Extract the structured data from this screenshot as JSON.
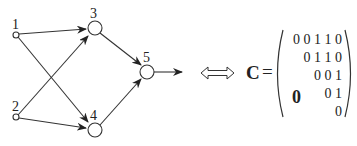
{
  "diagram": {
    "type": "directed network graph with connectivity matrix",
    "nodes": [
      {
        "id": "1",
        "label": "1",
        "kind": "input"
      },
      {
        "id": "2",
        "label": "2",
        "kind": "input"
      },
      {
        "id": "3",
        "label": "3",
        "kind": "hidden"
      },
      {
        "id": "4",
        "label": "4",
        "kind": "hidden"
      },
      {
        "id": "5",
        "label": "5",
        "kind": "output"
      }
    ],
    "edges": [
      {
        "from": "1",
        "to": "3"
      },
      {
        "from": "1",
        "to": "4"
      },
      {
        "from": "2",
        "to": "3"
      },
      {
        "from": "2",
        "to": "4"
      },
      {
        "from": "3",
        "to": "5"
      },
      {
        "from": "4",
        "to": "5"
      },
      {
        "from": "5",
        "to": "output"
      }
    ],
    "equivalence_symbol": "⟺",
    "matrix": {
      "name": "C",
      "equals": "=",
      "rows": [
        "0 0 1 1 0",
        "0 1 1 0",
        "0 0 1",
        "0 1",
        "0"
      ],
      "lower_triangle_label": "0"
    }
  }
}
